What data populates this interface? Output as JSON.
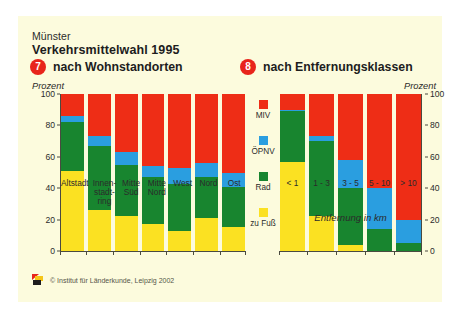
{
  "poster": {
    "city": "Münster",
    "title": "Verkehrsmittelwahl 1995",
    "left_panel_number": "7",
    "left_panel_title": "nach Wohnstandorten",
    "right_panel_number": "8",
    "right_panel_title": "nach Entfernungsklassen",
    "unit_label": "Prozent",
    "xaxis_title_right": "Entfernung in km",
    "copyright": "© Institut für Länderkunde, Leipzig 2002"
  },
  "colors": {
    "miv": "#ee2d16",
    "oepnv": "#2a9ee0",
    "rad": "#18852f",
    "zu_fuss": "#fbe122",
    "background": "#fcfbdd",
    "badge": "#e8241b",
    "axis": "#4a4a40",
    "text": "#2b2b2b"
  },
  "legend": {
    "items": [
      {
        "label": "MIV",
        "color": "#ee2d16"
      },
      {
        "label": "ÖPNV",
        "color": "#2a9ee0"
      },
      {
        "label": "Rad",
        "color": "#18852f"
      },
      {
        "label": "zu Fuß",
        "color": "#fbe122"
      }
    ]
  },
  "chart_data": [
    {
      "type": "bar",
      "id": "by-residence",
      "title": "nach Wohnstandorten",
      "subtitle": "Verkehrsmittelwahl 1995 — Münster",
      "stacked": true,
      "xlabel": "",
      "ylabel": "Prozent",
      "ylim": [
        0,
        100
      ],
      "yticks": [
        0,
        20,
        40,
        60,
        80,
        100
      ],
      "grid": false,
      "legend_position": "center-right",
      "categories": [
        "Altstadt",
        "Innen-\nstadt-\nring",
        "Mitte\nSüd",
        "Mitte\nNord",
        "West",
        "Nord",
        "Ost"
      ],
      "series": [
        {
          "name": "zu Fuß",
          "color": "#fbe122",
          "values": [
            51,
            26,
            22,
            17,
            13,
            21,
            15
          ]
        },
        {
          "name": "Rad",
          "color": "#18852f",
          "values": [
            31,
            41,
            33,
            30,
            30,
            26,
            26
          ]
        },
        {
          "name": "ÖPNV",
          "color": "#2a9ee0",
          "values": [
            4,
            6,
            8,
            7,
            10,
            9,
            9
          ]
        },
        {
          "name": "MIV",
          "color": "#ee2d16",
          "values": [
            14,
            27,
            37,
            46,
            47,
            44,
            50
          ]
        }
      ]
    },
    {
      "type": "bar",
      "id": "by-distance-class",
      "title": "nach Entfernungsklassen",
      "subtitle": "Verkehrsmittelwahl 1995 — Münster",
      "stacked": true,
      "xlabel": "Entfernung in km",
      "ylabel": "Prozent",
      "ylim": [
        0,
        100
      ],
      "yticks": [
        0,
        20,
        40,
        60,
        80,
        100
      ],
      "grid": false,
      "legend_position": "center-left",
      "categories": [
        "< 1",
        "1 - 3",
        "3 - 5",
        "5 - 10",
        "> 10"
      ],
      "series": [
        {
          "name": "zu Fuß",
          "color": "#fbe122",
          "values": [
            57,
            22,
            4,
            0,
            0
          ]
        },
        {
          "name": "Rad",
          "color": "#18852f",
          "values": [
            32,
            48,
            36,
            14,
            5
          ]
        },
        {
          "name": "ÖPNV",
          "color": "#2a9ee0",
          "values": [
            1,
            3,
            18,
            26,
            15
          ]
        },
        {
          "name": "MIV",
          "color": "#ee2d16",
          "values": [
            10,
            27,
            42,
            60,
            80
          ]
        }
      ]
    }
  ]
}
